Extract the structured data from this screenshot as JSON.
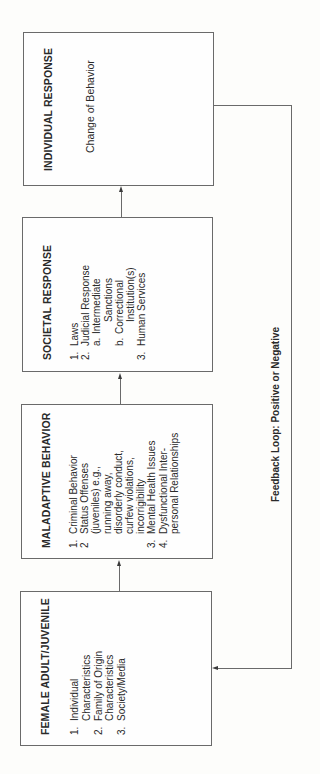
{
  "diagram": {
    "orientation": "rotated 90° counter-clockwise",
    "boxes": [
      {
        "id": "female",
        "title": "FEMALE ADULT/JUVENILE",
        "items": [
          {
            "num": "1.",
            "lines": [
              "Individual",
              "Characteristics"
            ]
          },
          {
            "num": "2.",
            "lines": [
              "Family of Origin",
              "Characteristics"
            ]
          },
          {
            "num": "3.",
            "lines": [
              "Society/Media"
            ]
          }
        ]
      },
      {
        "id": "maladaptive",
        "title": "MALADAPTIVE BEHAVIOR",
        "items": [
          {
            "num": "1.",
            "lines": [
              "Criminal Behavior"
            ]
          },
          {
            "num": "2",
            "lines": [
              "Status Offenses",
              "(juveniles) e.g.,",
              "running away,",
              "disorderly conduct,",
              "curfew violations,",
              "incorrigibility"
            ]
          },
          {
            "num": "3.",
            "lines": [
              "Mental Health Issues"
            ]
          },
          {
            "num": "4.",
            "lines": [
              "Dysfunctional Inter-",
              "personal Relationships"
            ]
          }
        ]
      },
      {
        "id": "societal",
        "title": "SOCIETAL RESPONSE",
        "items": [
          {
            "num": "1.",
            "lines": [
              "Laws"
            ]
          },
          {
            "num": "2.",
            "lines": [
              "Judicial Response"
            ],
            "sub": [
              {
                "num": "a.",
                "lines": [
                  "Intermediate",
                  "Sanctions"
                ]
              },
              {
                "num": "b.",
                "lines": [
                  "Correctional",
                  "Institution(s)"
                ]
              }
            ]
          },
          {
            "num": "3.",
            "lines": [
              "Human Services"
            ]
          }
        ]
      },
      {
        "id": "individual",
        "title": "INDIVIDUAL RESPONSE",
        "text": "Change of Behavior"
      }
    ],
    "feedback_label": "Feedback Loop: Positive or Negative",
    "flow": [
      "FEMALE ADULT/JUVENILE",
      "MALADAPTIVE BEHAVIOR",
      "SOCIETAL RESPONSE",
      "INDIVIDUAL RESPONSE"
    ],
    "colors": {
      "border": "#6a6a6a",
      "text": "#2a2a2a",
      "background": "#fdfdfb"
    }
  }
}
